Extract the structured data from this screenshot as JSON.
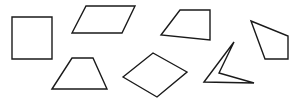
{
  "diagram": {
    "title": "",
    "background": "#ffffff",
    "stroke_color": "#1a1a1a",
    "shapes": [
      {
        "id": "square",
        "name": "square",
        "points": "12,17 52,17 52,59 12,59"
      },
      {
        "id": "parallelogram",
        "name": "parallelogram",
        "points": "72,33 86,6 135,6 122,33"
      },
      {
        "id": "quadrilateral-top",
        "name": "irregular-quadrilateral",
        "points": "161,35 180,10 210,10 210,40"
      },
      {
        "id": "quadrilateral-right",
        "name": "irregular-quadrilateral",
        "points": "251,21 288,36 288,59 265,59"
      },
      {
        "id": "trapezoid",
        "name": "trapezoid",
        "points": "52,89 72,58 93,58 107,89"
      },
      {
        "id": "rhombus",
        "name": "rhombus",
        "points": "123,77 153,53 187,72 157,97"
      },
      {
        "id": "concave-quadrilateral",
        "name": "concave-quadrilateral",
        "points": "204,82 234,42 219,73 254,83"
      }
    ]
  }
}
